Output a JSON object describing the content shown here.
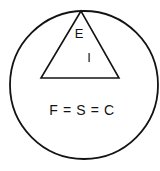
{
  "diagram": {
    "background_color": "#ffffff",
    "stroke_color": "#131313",
    "circle": {
      "name": "outer-circle",
      "center_x": 84,
      "center_y": 85,
      "radius": 74,
      "stroke_width": 1.8
    },
    "triangle": {
      "name": "inner-triangle",
      "apex_x": 81,
      "apex_y": 11,
      "bottom_left_x": 41,
      "bottom_left_y": 78,
      "bottom_right_x": 119,
      "bottom_right_y": 78,
      "stroke_width": 1.6
    },
    "labels": {
      "apex_label": {
        "text": "E",
        "x": 79,
        "y": 35
      },
      "inner_label": {
        "text": "I",
        "x": 89,
        "y": 59
      },
      "equation_label": {
        "text": "F = S = C",
        "x": 82,
        "y": 111
      }
    }
  }
}
